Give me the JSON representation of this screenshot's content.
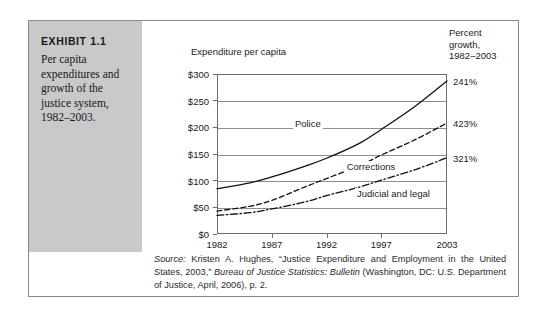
{
  "exhibit": {
    "label": "EXHIBIT 1.1",
    "caption": "Per capita expenditures and growth of the justice system, 1982–2003."
  },
  "source": {
    "prefix": "Source:",
    "part1": " Kristen A. Hughes, “Justice Expenditure and Employment in the United States, 2003,” ",
    "italic_title": "Bureau of Justice Statistics: Bulletin",
    "part2": " (Washington, DC: U.S. Department of Justice, April, 2006), p. 2."
  },
  "chart_data": {
    "type": "line",
    "title": "",
    "ylabel": "Expenditure per capita",
    "xlabel": "",
    "right_axis_label": "Percent growth, 1982–2003",
    "right_axis_label_lines": [
      "Percent",
      "growth,",
      "1982–2003"
    ],
    "x": [
      1982,
      1987,
      1992,
      1997,
      2003
    ],
    "xticklabels": [
      "1982",
      "1987",
      "1992",
      "1997",
      "2003"
    ],
    "xlim": [
      1982,
      2003
    ],
    "ylim": [
      0,
      300
    ],
    "yticks": [
      0,
      50,
      100,
      150,
      200,
      250,
      300
    ],
    "yticklabels": [
      "$0",
      "$50",
      "$100",
      "$150",
      "$200",
      "$250",
      "$300"
    ],
    "grid": true,
    "legend": "inline-labels",
    "series": [
      {
        "name": "Police",
        "style": "solid",
        "growth_label": "241%",
        "x": [
          1982,
          1985,
          1987,
          1990,
          1992,
          1995,
          1997,
          2000,
          2003
        ],
        "values": [
          85,
          96,
          107,
          127,
          142,
          170,
          196,
          238,
          287
        ]
      },
      {
        "name": "Corrections",
        "style": "dashed",
        "growth_label": "423%",
        "x": [
          1982,
          1985,
          1987,
          1990,
          1992,
          1995,
          1997,
          2000,
          2003
        ],
        "values": [
          43,
          52,
          63,
          88,
          104,
          128,
          148,
          176,
          208
        ]
      },
      {
        "name": "Judicial and legal",
        "style": "dashdot",
        "growth_label": "321%",
        "x": [
          1982,
          1985,
          1987,
          1990,
          1992,
          1995,
          1997,
          2000,
          2003
        ],
        "values": [
          35,
          40,
          47,
          60,
          72,
          88,
          101,
          120,
          143
        ]
      }
    ]
  },
  "colors": {
    "panel_gray": "#c9c9c9",
    "frame_border": "#8a8a8a",
    "ink": "#1b1b1b",
    "gridline": "#8d8d8d"
  }
}
